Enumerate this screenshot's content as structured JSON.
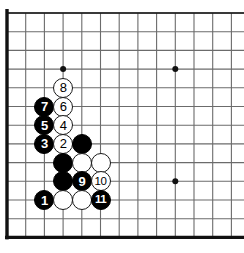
{
  "figure": {
    "kind": "go-board-diagram",
    "title": "",
    "board_size": 19,
    "visible_columns": 13,
    "visible_rows": 13,
    "background_color": "#ffffff",
    "line_color": "#6b6b6b",
    "edge_color": "#111111",
    "black_color": "#000000",
    "white_color": "#ffffff",
    "white_outline_color": "#1a1a1a"
  },
  "geometry": {
    "origin_x": 7,
    "origin_y": 13,
    "spacing": 18.7,
    "cols": 13,
    "rows": 13,
    "stone_diameter": 20
  },
  "star_points": [
    {
      "col": 4,
      "row": 4
    },
    {
      "col": 10,
      "row": 4
    },
    {
      "col": 10,
      "row": 10
    }
  ],
  "board_edges": {
    "left": true,
    "top": true,
    "bottom": true,
    "right": false
  },
  "stones": [
    {
      "col": 4,
      "row": 5,
      "color": "white",
      "label": "8"
    },
    {
      "col": 3,
      "row": 6,
      "color": "black",
      "label": "7"
    },
    {
      "col": 4,
      "row": 6,
      "color": "white",
      "label": "6"
    },
    {
      "col": 3,
      "row": 7,
      "color": "black",
      "label": "5"
    },
    {
      "col": 4,
      "row": 7,
      "color": "white",
      "label": "4"
    },
    {
      "col": 3,
      "row": 8,
      "color": "black",
      "label": "3"
    },
    {
      "col": 4,
      "row": 8,
      "color": "white",
      "label": "2"
    },
    {
      "col": 5,
      "row": 8,
      "color": "black",
      "label": ""
    },
    {
      "col": 4,
      "row": 9,
      "color": "black",
      "label": ""
    },
    {
      "col": 5,
      "row": 9,
      "color": "white",
      "label": ""
    },
    {
      "col": 6,
      "row": 9,
      "color": "white",
      "label": ""
    },
    {
      "col": 4,
      "row": 10,
      "color": "black",
      "label": ""
    },
    {
      "col": 5,
      "row": 10,
      "color": "black",
      "label": "9"
    },
    {
      "col": 6,
      "row": 10,
      "color": "white",
      "label": "10"
    },
    {
      "col": 3,
      "row": 11,
      "color": "black",
      "label": "1"
    },
    {
      "col": 4,
      "row": 11,
      "color": "white",
      "label": ""
    },
    {
      "col": 5,
      "row": 11,
      "color": "white",
      "label": ""
    },
    {
      "col": 6,
      "row": 11,
      "color": "black",
      "label": "11"
    }
  ],
  "move_sequence": [
    "1",
    "2",
    "3",
    "4",
    "5",
    "6",
    "7",
    "8",
    "9",
    "10",
    "11"
  ]
}
